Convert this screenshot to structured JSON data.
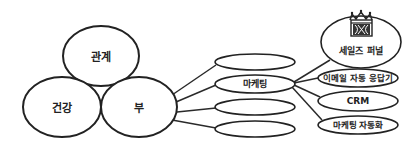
{
  "diagram": {
    "core_circles": [
      {
        "id": "relationship",
        "label": "관계"
      },
      {
        "id": "health",
        "label": "건강"
      },
      {
        "id": "wealth",
        "label": "부"
      }
    ],
    "wealth_branches": [
      {
        "id": "branch-1",
        "label": ""
      },
      {
        "id": "marketing",
        "label": "마케팅"
      },
      {
        "id": "branch-3",
        "label": ""
      },
      {
        "id": "branch-4",
        "label": ""
      }
    ],
    "marketing_branches": [
      {
        "id": "sales-funnel",
        "label": "세일즈 퍼널",
        "icon": "crown-funnel-icon"
      },
      {
        "id": "email-autoresponder",
        "label": "이메일 자동 응답기"
      },
      {
        "id": "crm",
        "label": "CRM"
      },
      {
        "id": "marketing-automation",
        "label": "마케팅 자동화"
      }
    ]
  },
  "colors": {
    "stroke": "#222222",
    "background": "#ffffff"
  }
}
